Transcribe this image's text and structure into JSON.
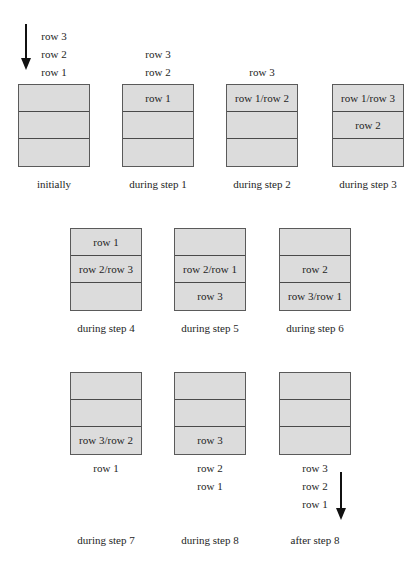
{
  "diagram": {
    "title": "",
    "arrow_color": "#111111",
    "box_fill": "#dcdcdc",
    "box_border": "#5a5a5a",
    "panels": [
      {
        "caption": "initially",
        "above": [
          "row 3",
          "row 2",
          "row 1"
        ],
        "cells": [
          "",
          "",
          ""
        ],
        "below": []
      },
      {
        "caption": "during step 1",
        "above": [
          "row 3",
          "row 2"
        ],
        "cells": [
          "row 1",
          "",
          ""
        ],
        "below": []
      },
      {
        "caption": "during step 2",
        "above": [
          "row 3"
        ],
        "cells": [
          "row 1/row 2",
          "",
          ""
        ],
        "below": []
      },
      {
        "caption": "during step 3",
        "above": [],
        "cells": [
          "row 1/row 3",
          "row 2",
          ""
        ],
        "below": []
      },
      {
        "caption": "during step 4",
        "above": [],
        "cells": [
          "row 1",
          "row 2/row 3",
          ""
        ],
        "below": []
      },
      {
        "caption": "during step 5",
        "above": [],
        "cells": [
          "",
          "row 2/row 1",
          "row 3"
        ],
        "below": []
      },
      {
        "caption": "during step 6",
        "above": [],
        "cells": [
          "",
          "row 2",
          "row 3/row 1"
        ],
        "below": []
      },
      {
        "caption": "during step 7",
        "above": [],
        "cells": [
          "",
          "",
          "row 3/row 2"
        ],
        "below": [
          "row 1"
        ]
      },
      {
        "caption": "during step 8",
        "above": [],
        "cells": [
          "",
          "",
          "row 3"
        ],
        "below": [
          "row 2",
          "row 1"
        ]
      },
      {
        "caption": "after step 8",
        "above": [],
        "cells": [
          "",
          "",
          ""
        ],
        "below": [
          "row 3",
          "row 2",
          "row 1"
        ]
      }
    ]
  }
}
